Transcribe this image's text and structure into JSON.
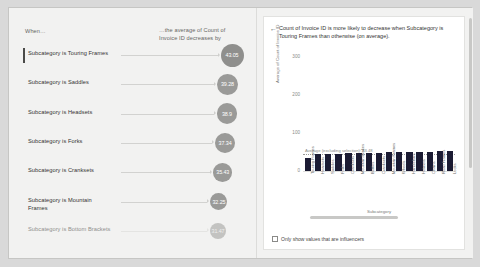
{
  "visual": {
    "type": "key-influencers",
    "left_pane": {
      "when_header": "When…",
      "effect_header": "…the average of Count of Invoice ID decreases by",
      "rows": [
        {
          "label": "Subcategory is Touring Frames",
          "value": "43.05",
          "selected": true,
          "faded": false
        },
        {
          "label": "Subcategory is Saddles",
          "value": "39.28",
          "selected": false,
          "faded": false
        },
        {
          "label": "Subcategory is Headsets",
          "value": "38.9",
          "selected": false,
          "faded": false
        },
        {
          "label": "Subcategory is Forks",
          "value": "37.34",
          "selected": false,
          "faded": false
        },
        {
          "label": "Subcategory is Cranksets",
          "value": "35.43",
          "selected": false,
          "faded": false
        },
        {
          "label": "Subcategory is Mountain Frames",
          "value": "32.25",
          "selected": false,
          "faded": false
        },
        {
          "label": "Subcategory is Bottom Brackets",
          "value": "31.47",
          "selected": false,
          "faded": true
        }
      ]
    },
    "right_pane": {
      "back_icon": "left-arrow-icon",
      "title": "Count of Invoice ID is more likely to decrease when Subcategory is Touring Frames than otherwise (on average).",
      "checkbox": {
        "label": "Only show values that are influencers",
        "checked": false
      },
      "scrollbar_horizontal": "horizontal-scrollbar",
      "scrollbar_vertical": "vertical-scrollbar"
    }
  },
  "chart_data": {
    "type": "bar",
    "title": "",
    "xlabel": "Subcategory",
    "ylabel": "Average of Count of Invoice ID",
    "ylim": [
      0,
      320
    ],
    "yticks": [
      0,
      100,
      200,
      300
    ],
    "ytick_labels": [
      "0",
      "100",
      "200",
      "300"
    ],
    "grid": false,
    "legend": "none",
    "bar_color": "#1b1b33",
    "categories": [
      "Touring Frames",
      "Headsets",
      "Saddles",
      "Forks",
      "Cranksets",
      "Mountain Brakes",
      "Bottles",
      "Cranksets",
      "Mountain Frames",
      "Wheels",
      "Handlebars",
      "Helmets",
      "Chains",
      "Road Frames",
      "Locks"
    ],
    "values": [
      33,
      44,
      44,
      45,
      46,
      47,
      47,
      48,
      49,
      49,
      50,
      50,
      51,
      52,
      52
    ],
    "annotations": [
      {
        "type": "reference-line",
        "label": "Average (excluding selection): 43.48",
        "value": 43.48,
        "style": "dotted"
      }
    ]
  }
}
